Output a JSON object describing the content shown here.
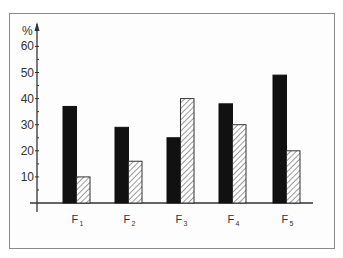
{
  "chart_data": {
    "type": "bar",
    "title": "",
    "xlabel": "",
    "ylabel": "%",
    "ylim": [
      0,
      65
    ],
    "yticks": [
      10,
      20,
      30,
      40,
      50,
      60
    ],
    "grid": false,
    "legend": null,
    "categories": [
      "F1",
      "F2",
      "F3",
      "F4",
      "F5"
    ],
    "category_display": [
      {
        "main": "F",
        "sub": "1"
      },
      {
        "main": "F",
        "sub": "2"
      },
      {
        "main": "F",
        "sub": "3"
      },
      {
        "main": "F",
        "sub": "4"
      },
      {
        "main": "F",
        "sub": "5"
      }
    ],
    "series": [
      {
        "name": "Series A (solid black)",
        "style": "solid",
        "color": "#111111",
        "values": [
          37,
          29,
          25,
          38,
          49
        ]
      },
      {
        "name": "Series B (hatched)",
        "style": "hatched",
        "color": "#555555",
        "values": [
          10,
          16,
          40,
          30,
          20
        ]
      }
    ]
  },
  "axis": {
    "unit_label": "%",
    "tick_labels": [
      "10",
      "20",
      "30",
      "40",
      "50",
      "60"
    ]
  }
}
